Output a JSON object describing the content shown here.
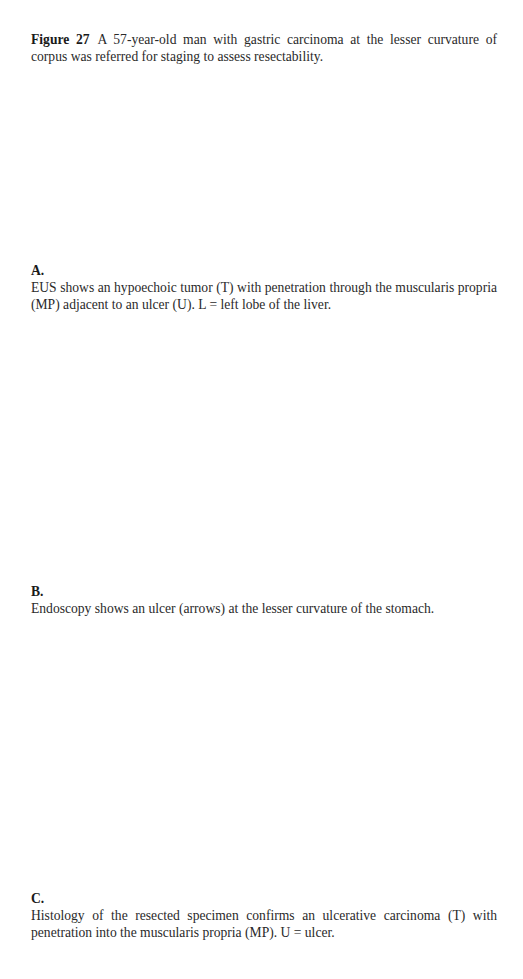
{
  "figure": {
    "label": "Figure 27",
    "caption": "A 57-year-old man with gastric carcinoma at the lesser curvature of corpus was referred for staging to assess resectability."
  },
  "panels": [
    {
      "letter": "A.",
      "text": "EUS shows an hypoechoic tumor (T) with penetration through the muscularis propria (MP) adjacent to an ulcer (U). L = left lobe of the liver."
    },
    {
      "letter": "B.",
      "text": "Endoscopy shows an ulcer (arrows) at the lesser curvature of the stomach."
    },
    {
      "letter": "C.",
      "text": "Histology of the resected specimen confirms an ulcerative carcinoma (T) with penetration into the muscularis propria (MP). U = ulcer."
    }
  ]
}
